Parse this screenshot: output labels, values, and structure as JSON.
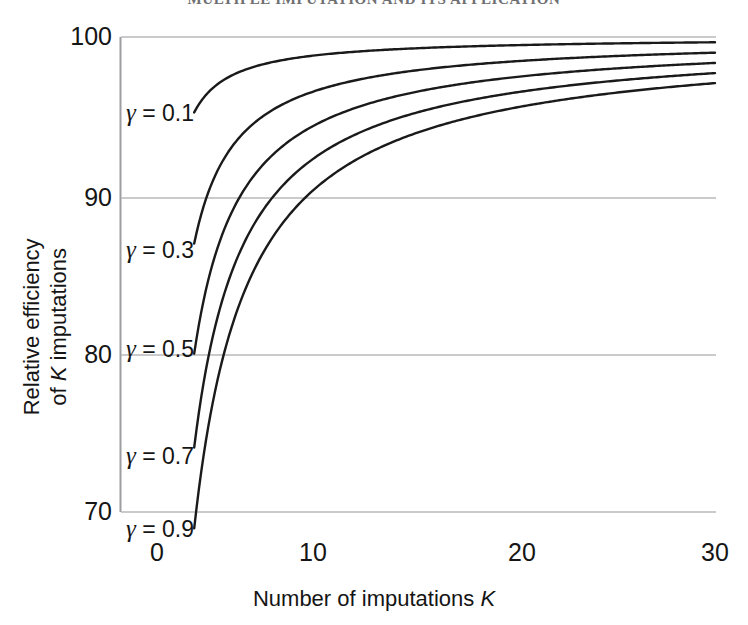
{
  "running_header": "MULTIPLE IMPUTATION AND ITS APPLICATION",
  "axes": {
    "x_title_text": "Number of imputations ",
    "x_title_symbol": "K",
    "y_title_line1": "Relative efficiency",
    "y_title_line2_pre": "of ",
    "y_title_symbol": "K",
    "y_title_line2_post": " imputations",
    "xticks": [
      "0",
      "10",
      "20",
      "30"
    ],
    "yticks": [
      "100",
      "90",
      "80",
      "70"
    ]
  },
  "annotations": [
    {
      "symbol": "γ",
      "text": " = 0.1"
    },
    {
      "symbol": "γ",
      "text": " = 0.3"
    },
    {
      "symbol": "γ",
      "text": " = 0.5"
    },
    {
      "symbol": "γ",
      "text": " = 0.7"
    },
    {
      "symbol": "γ",
      "text": " = 0.9"
    }
  ],
  "colors": {
    "curve": "#1a1a1a",
    "gridline": "#b9b9bd",
    "axis": "#9d9da2",
    "background": "#ffffff",
    "text": "#151515",
    "header_text": "#6f6f72"
  },
  "chart_data": {
    "type": "line",
    "title": "",
    "xlabel": "Number of imputations K",
    "ylabel": "Relative efficiency of K imputations",
    "xlim": [
      0,
      30
    ],
    "ylim": [
      70,
      100
    ],
    "grid": true,
    "grid_axis": "y",
    "legend": "inline-curve-labels",
    "xticks": [
      0,
      10,
      20,
      30
    ],
    "yticks": [
      70,
      80,
      90,
      100
    ],
    "formula": "100 / (1 + gamma / K)",
    "x": [
      2,
      3,
      4,
      5,
      6,
      7,
      8,
      9,
      10,
      12,
      14,
      16,
      18,
      20,
      22,
      24,
      26,
      28,
      30
    ],
    "series": [
      {
        "name": "γ = 0.1",
        "gamma": 0.1,
        "values": [
          95.24,
          96.77,
          97.56,
          98.04,
          98.36,
          98.59,
          98.77,
          98.9,
          99.01,
          99.17,
          99.29,
          99.38,
          99.45,
          99.5,
          99.55,
          99.59,
          99.62,
          99.64,
          99.67
        ]
      },
      {
        "name": "γ = 0.3",
        "gamma": 0.3,
        "values": [
          86.96,
          90.91,
          93.02,
          94.34,
          95.24,
          95.89,
          96.39,
          96.77,
          97.09,
          97.56,
          97.9,
          98.16,
          98.36,
          98.52,
          98.65,
          98.77,
          98.86,
          98.94,
          99.01
        ]
      },
      {
        "name": "γ = 0.5",
        "gamma": 0.5,
        "values": [
          80.0,
          85.71,
          88.89,
          90.91,
          92.31,
          93.33,
          94.12,
          94.74,
          95.24,
          96.0,
          96.55,
          96.97,
          97.3,
          97.56,
          97.78,
          97.96,
          98.11,
          98.25,
          98.36
        ]
      },
      {
        "name": "γ = 0.7",
        "gamma": 0.7,
        "values": [
          74.07,
          81.08,
          85.11,
          87.72,
          89.55,
          90.91,
          91.95,
          92.78,
          93.46,
          94.49,
          95.24,
          95.81,
          96.26,
          96.62,
          96.92,
          97.16,
          97.38,
          97.56,
          97.72
        ]
      },
      {
        "name": "γ = 0.9",
        "gamma": 0.9,
        "values": [
          68.97,
          76.92,
          81.63,
          84.75,
          86.96,
          88.61,
          89.89,
          90.91,
          91.74,
          93.02,
          93.96,
          94.67,
          95.24,
          95.69,
          96.07,
          96.39,
          96.65,
          96.88,
          97.09
        ]
      }
    ]
  }
}
